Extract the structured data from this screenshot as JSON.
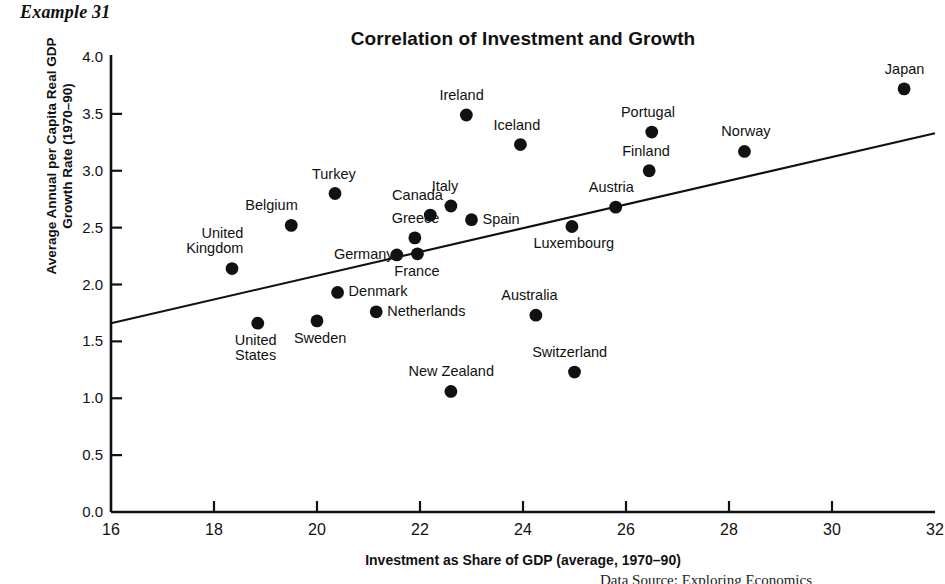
{
  "example_label": "Example 31",
  "footer_partial_text": "Data Source: Exploring Economics",
  "axis": {
    "y_title_line1": "Average Annual per Capita Real GDP",
    "y_title_line2": "Growth Rate (1970–90)",
    "x_title": "Investment as Share of GDP (average, 1970–90)",
    "y_ticks": [
      "0.0",
      "0.5",
      "1.0",
      "1.5",
      "2.0",
      "2.5",
      "3.0",
      "3.5",
      "4.0"
    ],
    "x_ticks": [
      "16",
      "18",
      "20",
      "22",
      "24",
      "26",
      "28",
      "30",
      "32"
    ]
  },
  "chart_data": {
    "type": "scatter",
    "title": "Correlation of Investment and Growth",
    "xlabel": "Investment as Share of GDP (average, 1970–90)",
    "ylabel": "Average Annual per Capita Real GDP Growth Rate (1970–90)",
    "xlim": [
      16,
      32
    ],
    "ylim": [
      0.0,
      4.0
    ],
    "x_tick_step": 2,
    "y_tick_step": 0.5,
    "grid": false,
    "legend": "none",
    "marker": "filled-circle",
    "marker_color": "#111111",
    "trendline": {
      "type": "linear",
      "color": "#111111",
      "x_start": 16,
      "y_start": 1.66,
      "x_end": 32,
      "y_end": 3.33
    },
    "points": [
      {
        "name": "United Kingdom",
        "x": 18.35,
        "y": 2.14,
        "label_lines": [
          "United",
          "Kingdom"
        ],
        "label_pos": "above-left"
      },
      {
        "name": "United States",
        "x": 18.85,
        "y": 1.66,
        "label_lines": [
          "United",
          "States"
        ],
        "label_pos": "below"
      },
      {
        "name": "Belgium",
        "x": 19.5,
        "y": 2.52,
        "label_lines": [
          "Belgium"
        ],
        "label_pos": "above-left"
      },
      {
        "name": "Sweden",
        "x": 20.0,
        "y": 1.68,
        "label_lines": [
          "Sweden"
        ],
        "label_pos": "below"
      },
      {
        "name": "Turkey",
        "x": 20.35,
        "y": 2.8,
        "label_lines": [
          "Turkey"
        ],
        "label_pos": "above"
      },
      {
        "name": "Denmark",
        "x": 20.4,
        "y": 1.93,
        "label_lines": [
          "Denmark"
        ],
        "label_pos": "right"
      },
      {
        "name": "Netherlands",
        "x": 21.15,
        "y": 1.76,
        "label_lines": [
          "Netherlands"
        ],
        "label_pos": "right"
      },
      {
        "name": "Germany",
        "x": 21.55,
        "y": 2.26,
        "label_lines": [
          "Germany"
        ],
        "label_pos": "left"
      },
      {
        "name": "Greece",
        "x": 21.9,
        "y": 2.41,
        "label_lines": [
          "Greece"
        ],
        "label_pos": "above"
      },
      {
        "name": "France",
        "x": 21.95,
        "y": 2.27,
        "label_lines": [
          "France"
        ],
        "label_pos": "below"
      },
      {
        "name": "Canada",
        "x": 22.2,
        "y": 2.61,
        "label_lines": [
          "Canada"
        ],
        "label_pos": "above-left"
      },
      {
        "name": "New Zealand",
        "x": 22.6,
        "y": 1.06,
        "label_lines": [
          "New Zealand"
        ],
        "label_pos": "above"
      },
      {
        "name": "Italy",
        "x": 22.6,
        "y": 2.69,
        "label_lines": [
          "Italy"
        ],
        "label_pos": "above"
      },
      {
        "name": "Ireland",
        "x": 22.9,
        "y": 3.49,
        "label_lines": [
          "Ireland"
        ],
        "label_pos": "above"
      },
      {
        "name": "Spain",
        "x": 23.0,
        "y": 2.57,
        "label_lines": [
          "Spain"
        ],
        "label_pos": "right"
      },
      {
        "name": "Iceland",
        "x": 23.95,
        "y": 3.23,
        "label_lines": [
          "Iceland"
        ],
        "label_pos": "above"
      },
      {
        "name": "Australia",
        "x": 24.25,
        "y": 1.73,
        "label_lines": [
          "Australia"
        ],
        "label_pos": "above"
      },
      {
        "name": "Luxembourg",
        "x": 24.95,
        "y": 2.51,
        "label_lines": [
          "Luxembourg"
        ],
        "label_pos": "below"
      },
      {
        "name": "Switzerland",
        "x": 25.0,
        "y": 1.23,
        "label_lines": [
          "Switzerland"
        ],
        "label_pos": "above"
      },
      {
        "name": "Austria",
        "x": 25.8,
        "y": 2.68,
        "label_lines": [
          "Austria"
        ],
        "label_pos": "above"
      },
      {
        "name": "Finland",
        "x": 26.45,
        "y": 3.0,
        "label_lines": [
          "Finland"
        ],
        "label_pos": "above"
      },
      {
        "name": "Portugal",
        "x": 26.5,
        "y": 3.34,
        "label_lines": [
          "Portugal"
        ],
        "label_pos": "above"
      },
      {
        "name": "Norway",
        "x": 28.3,
        "y": 3.17,
        "label_lines": [
          "Norway"
        ],
        "label_pos": "above"
      },
      {
        "name": "Japan",
        "x": 31.4,
        "y": 3.72,
        "label_lines": [
          "Japan"
        ],
        "label_pos": "above"
      }
    ]
  }
}
